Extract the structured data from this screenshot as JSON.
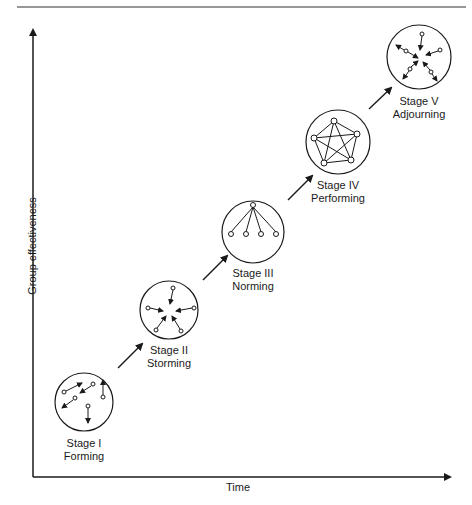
{
  "diagram": {
    "title_rule": true,
    "axes": {
      "x_label": "Time",
      "y_label": "Group effectiveness"
    },
    "stages": [
      {
        "id": 1,
        "label_line1": "Stage I",
        "label_line2": "Forming",
        "pattern": "scattered-arrows"
      },
      {
        "id": 2,
        "label_line1": "Stage II",
        "label_line2": "Storming",
        "pattern": "converging-arrows"
      },
      {
        "id": 3,
        "label_line1": "Stage III",
        "label_line2": "Norming",
        "pattern": "hierarchy-tree"
      },
      {
        "id": 4,
        "label_line1": "Stage IV",
        "label_line2": "Performing",
        "pattern": "fully-connected-network"
      },
      {
        "id": 5,
        "label_line1": "Stage V",
        "label_line2": "Adjourning",
        "pattern": "dispersing-arrows"
      }
    ],
    "caption": ""
  }
}
